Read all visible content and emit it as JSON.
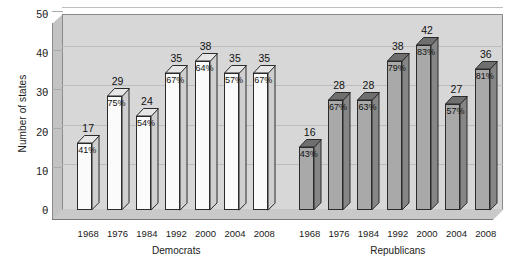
{
  "chart_data": {
    "type": "bar",
    "title": "",
    "subtitle": "",
    "xlabel": "",
    "ylabel": "Number of states",
    "ylim": [
      0,
      50
    ],
    "yticks": [
      0,
      10,
      20,
      30,
      40,
      50
    ],
    "grid": true,
    "legend_position": "none",
    "style": "3d-column",
    "groups": [
      {
        "name": "Democrats",
        "categories": [
          "1968",
          "1976",
          "1984",
          "1992",
          "2000",
          "2004",
          "2008"
        ],
        "values": [
          17,
          29,
          24,
          35,
          38,
          35,
          35
        ],
        "percent_labels": [
          "41%",
          "75%",
          "54%",
          "67%",
          "64%",
          "57%",
          "67%"
        ],
        "bar_fill": "#fbfbfb"
      },
      {
        "name": "Republicans",
        "categories": [
          "1968",
          "1976",
          "1984",
          "1992",
          "2000",
          "2004",
          "2008"
        ],
        "values": [
          16,
          28,
          28,
          38,
          42,
          27,
          36
        ],
        "percent_labels": [
          "43%",
          "67%",
          "63%",
          "79%",
          "83%",
          "57%",
          "81%"
        ],
        "bar_fill": "#a9a9a9"
      }
    ],
    "colors": {
      "plot_background": "#d7d7d7",
      "wall_side": "#c3c3c3",
      "gridline": "#bdbdbd",
      "axis": "#4d4d4d",
      "text": "#1a1a1a",
      "democrat_bar": "#fbfbfb",
      "republican_bar": "#a9a9a9",
      "bar_outline": "#2b2b2b"
    }
  }
}
